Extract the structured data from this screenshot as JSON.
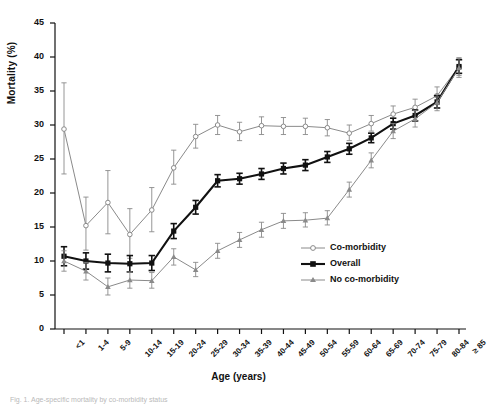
{
  "figure": {
    "y_axis_title": "Mortality (%)",
    "x_axis_title": "Age (years)",
    "caption": "Fig. 1. Age-specific mortality by co-morbidity status"
  },
  "legend": {
    "items": [
      {
        "label": "Co-morbidity",
        "marker": "open-circle",
        "color": "#8a8a8a"
      },
      {
        "label": "Overall",
        "marker": "filled-square",
        "color": "#111111"
      },
      {
        "label": "No co-morbidity",
        "marker": "filled-triangle",
        "color": "#8a8a8a"
      }
    ]
  },
  "chart_data": {
    "type": "line",
    "title": "",
    "xlabel": "Age (years)",
    "ylabel": "Mortality (%)",
    "ylim": [
      0,
      45
    ],
    "yticks": [
      0,
      5,
      10,
      15,
      20,
      25,
      30,
      35,
      40,
      45
    ],
    "grid": false,
    "legend_position": "inside-lower-right",
    "error_bars": "95% CI",
    "categories": [
      "<1",
      "1-4",
      "5-9",
      "10-14",
      "15-19",
      "20-24",
      "25-29",
      "30-34",
      "35-39",
      "40-44",
      "45-49",
      "50-54",
      "55-59",
      "60-64",
      "65-69",
      "70-74",
      "75-79",
      "80-84",
      "≥ 85"
    ],
    "series": [
      {
        "name": "Co-morbidity",
        "marker": "open-circle",
        "color": "#8a8a8a",
        "values": [
          29.4,
          15.2,
          18.6,
          13.9,
          17.5,
          23.7,
          28.3,
          30.0,
          29.0,
          29.9,
          29.8,
          29.8,
          29.6,
          28.8,
          30.2,
          31.6,
          32.6,
          34.3,
          38.6
        ],
        "err_low": [
          22.8,
          11.6,
          14.0,
          10.4,
          14.3,
          21.3,
          26.6,
          28.6,
          27.7,
          28.6,
          28.6,
          28.6,
          28.4,
          27.7,
          29.1,
          30.4,
          31.4,
          33.0,
          37.3
        ],
        "err_high": [
          36.2,
          19.4,
          23.3,
          17.7,
          20.8,
          26.3,
          30.1,
          31.4,
          30.4,
          31.2,
          31.1,
          31.0,
          30.8,
          30.0,
          31.4,
          32.8,
          33.8,
          35.6,
          39.9
        ]
      },
      {
        "name": "Overall",
        "marker": "filled-square",
        "color": "#111111",
        "values": [
          10.7,
          10.0,
          9.7,
          9.6,
          9.7,
          14.4,
          17.9,
          21.8,
          22.1,
          22.8,
          23.6,
          24.1,
          25.3,
          26.5,
          28.1,
          30.2,
          31.4,
          33.4,
          38.6
        ],
        "err_low": [
          9.3,
          8.8,
          8.4,
          8.4,
          8.6,
          13.3,
          16.9,
          20.9,
          21.3,
          22.0,
          22.8,
          23.3,
          24.5,
          25.7,
          27.4,
          29.4,
          30.6,
          32.5,
          37.6
        ],
        "err_high": [
          12.1,
          11.2,
          11.0,
          10.8,
          10.8,
          15.5,
          18.9,
          22.7,
          22.9,
          23.6,
          24.4,
          24.9,
          26.1,
          27.3,
          28.8,
          31.0,
          32.2,
          34.3,
          39.6
        ]
      },
      {
        "name": "No co-morbidity",
        "marker": "filled-triangle",
        "color": "#8a8a8a",
        "values": [
          10.0,
          8.5,
          6.2,
          7.2,
          7.1,
          10.6,
          8.7,
          11.5,
          13.1,
          14.6,
          15.9,
          16.0,
          16.3,
          20.5,
          24.8,
          29.1,
          30.9,
          33.3,
          38.4
        ],
        "err_low": [
          8.5,
          7.2,
          5.0,
          6.0,
          6.0,
          9.4,
          7.7,
          10.4,
          12.0,
          13.5,
          14.8,
          15.0,
          15.3,
          19.4,
          23.7,
          28.0,
          29.7,
          32.1,
          37.0
        ],
        "err_high": [
          11.5,
          9.8,
          7.5,
          8.4,
          8.3,
          11.8,
          9.8,
          12.6,
          14.2,
          15.7,
          17.0,
          17.1,
          17.4,
          21.6,
          25.9,
          30.2,
          32.1,
          34.5,
          39.8
        ]
      }
    ]
  }
}
